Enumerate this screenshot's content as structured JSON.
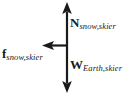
{
  "diagram": {
    "background_color": "#ffffff",
    "stroke_color": "#1a1a1a",
    "origin": {
      "x": 67,
      "y": 45
    },
    "forces": [
      {
        "id": "normal",
        "symbol": "N",
        "subscript": "snow,skier",
        "direction": "up",
        "label_position": "right-of-shaft-upper"
      },
      {
        "id": "weight",
        "symbol": "W",
        "subscript": "Earth,skier",
        "direction": "down",
        "label_position": "right-of-shaft-lower"
      },
      {
        "id": "friction",
        "symbol": "f",
        "subscript": "snow,skier",
        "direction": "left",
        "label_position": "left-of-arrow"
      }
    ]
  }
}
